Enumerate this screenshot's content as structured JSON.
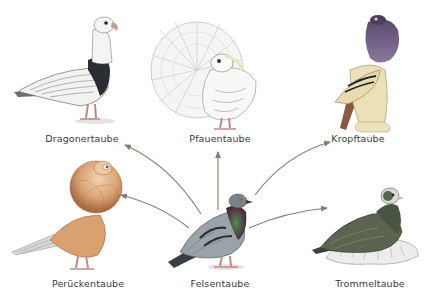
{
  "diagram": {
    "title": "",
    "center": {
      "id": "felsentaube",
      "label": "Felsentaube"
    },
    "nodes": [
      {
        "id": "dragonertaube",
        "label": "Dragonertaube",
        "x": 82,
        "y": 133
      },
      {
        "id": "pfauentaube",
        "label": "Pfauentaube",
        "x": 220,
        "y": 133
      },
      {
        "id": "kropftaube",
        "label": "Kropftaube",
        "x": 358,
        "y": 133
      },
      {
        "id": "perueckentaube",
        "label": "Perückentaube",
        "x": 88,
        "y": 278
      },
      {
        "id": "felsentaube",
        "label": "Felsentaube",
        "x": 220,
        "y": 278
      },
      {
        "id": "trommeltaube",
        "label": "Trommeltaube",
        "x": 370,
        "y": 278
      }
    ],
    "edges": [
      {
        "from": "felsentaube",
        "to": "dragonertaube"
      },
      {
        "from": "felsentaube",
        "to": "pfauentaube"
      },
      {
        "from": "felsentaube",
        "to": "kropftaube"
      },
      {
        "from": "felsentaube",
        "to": "perueckentaube"
      },
      {
        "from": "felsentaube",
        "to": "trommeltaube"
      }
    ],
    "colors": {
      "arrow": "#8a7a76",
      "label_text": "#3a3a3a",
      "background": "#ffffff"
    }
  }
}
